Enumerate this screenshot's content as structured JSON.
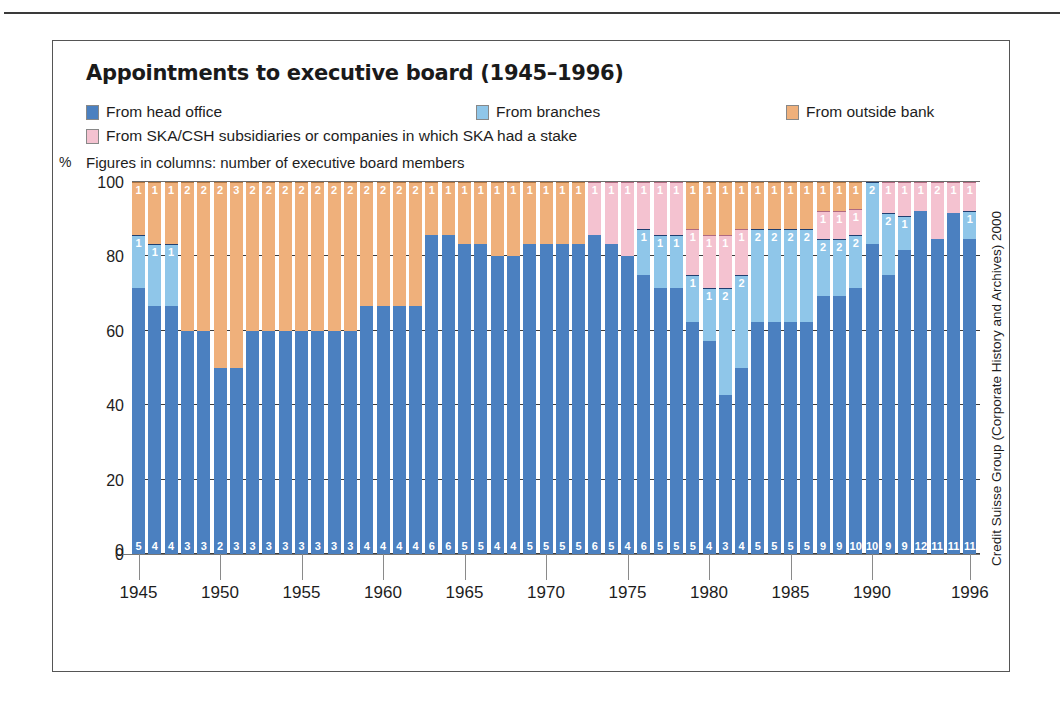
{
  "title": "Appointments to executive board (1945–1996)",
  "note": "Figures in columns: number of executive board members",
  "pct_symbol": "%",
  "source": "Credit Suisse Group (Corporate History and Archives) 2000",
  "colors": {
    "head_office": "#4b80c0",
    "branches": "#8fc6e9",
    "outside_bank": "#efb07b",
    "subsidiaries": "#f4c2d0"
  },
  "legend": [
    {
      "label": "From head office",
      "color_key": "head_office",
      "row": 0,
      "x": 0
    },
    {
      "label": "From branches",
      "color_key": "branches",
      "row": 0,
      "x": 390
    },
    {
      "label": "From outside bank",
      "color_key": "outside_bank",
      "row": 0,
      "x": 700
    },
    {
      "label": "From SKA/CSH subsidiaries or companies in which SKA had a stake",
      "color_key": "subsidiaries",
      "row": 1,
      "x": 0
    }
  ],
  "chart_data": {
    "type": "bar",
    "subtype": "100% stacked column",
    "title": "Appointments to executive board (1945–1996)",
    "xlabel": "",
    "ylabel": "%",
    "ylim": [
      0,
      100
    ],
    "yticks": [
      0,
      20,
      40,
      60,
      80,
      100
    ],
    "grid": true,
    "legend_position": "top",
    "note": "Figures in columns: number of executive board members",
    "source": "Credit Suisse Group (Corporate History and Archives) 2000",
    "series_order": [
      "head_office",
      "branches",
      "subsidiaries",
      "outside_bank"
    ],
    "series_labels": {
      "head_office": "From head office",
      "branches": "From branches",
      "subsidiaries": "From SKA/CSH subsidiaries or companies in which SKA had a stake",
      "outside_bank": "From outside bank"
    },
    "x_tick_years": [
      1945,
      1950,
      1955,
      1960,
      1965,
      1970,
      1975,
      1980,
      1985,
      1990,
      1996
    ],
    "categories": [
      1945,
      1946,
      1947,
      1948,
      1949,
      1950,
      1951,
      1952,
      1953,
      1954,
      1955,
      1956,
      1957,
      1958,
      1959,
      1960,
      1961,
      1962,
      1963,
      1964,
      1965,
      1966,
      1967,
      1968,
      1969,
      1970,
      1971,
      1972,
      1973,
      1974,
      1975,
      1976,
      1977,
      1978,
      1979,
      1980,
      1981,
      1982,
      1983,
      1984,
      1985,
      1986,
      1987,
      1988,
      1989,
      1990,
      1991,
      1992,
      1993,
      1994,
      1995,
      1996
    ],
    "columns": [
      {
        "year": 1945,
        "head_office": 5,
        "branches": 1,
        "subsidiaries": 0,
        "outside_bank": 1
      },
      {
        "year": 1946,
        "head_office": 4,
        "branches": 1,
        "subsidiaries": 0,
        "outside_bank": 1
      },
      {
        "year": 1947,
        "head_office": 4,
        "branches": 1,
        "subsidiaries": 0,
        "outside_bank": 1
      },
      {
        "year": 1948,
        "head_office": 3,
        "branches": 0,
        "subsidiaries": 0,
        "outside_bank": 2
      },
      {
        "year": 1949,
        "head_office": 3,
        "branches": 0,
        "subsidiaries": 0,
        "outside_bank": 2
      },
      {
        "year": 1950,
        "head_office": 2,
        "branches": 0,
        "subsidiaries": 0,
        "outside_bank": 2
      },
      {
        "year": 1951,
        "head_office": 3,
        "branches": 0,
        "subsidiaries": 0,
        "outside_bank": 3
      },
      {
        "year": 1952,
        "head_office": 3,
        "branches": 0,
        "subsidiaries": 0,
        "outside_bank": 2
      },
      {
        "year": 1953,
        "head_office": 3,
        "branches": 0,
        "subsidiaries": 0,
        "outside_bank": 2
      },
      {
        "year": 1954,
        "head_office": 3,
        "branches": 0,
        "subsidiaries": 0,
        "outside_bank": 2
      },
      {
        "year": 1955,
        "head_office": 3,
        "branches": 0,
        "subsidiaries": 0,
        "outside_bank": 2
      },
      {
        "year": 1956,
        "head_office": 3,
        "branches": 0,
        "subsidiaries": 0,
        "outside_bank": 2
      },
      {
        "year": 1957,
        "head_office": 3,
        "branches": 0,
        "subsidiaries": 0,
        "outside_bank": 2
      },
      {
        "year": 1958,
        "head_office": 3,
        "branches": 0,
        "subsidiaries": 0,
        "outside_bank": 2
      },
      {
        "year": 1959,
        "head_office": 4,
        "branches": 0,
        "subsidiaries": 0,
        "outside_bank": 2
      },
      {
        "year": 1960,
        "head_office": 4,
        "branches": 0,
        "subsidiaries": 0,
        "outside_bank": 2
      },
      {
        "year": 1961,
        "head_office": 4,
        "branches": 0,
        "subsidiaries": 0,
        "outside_bank": 2
      },
      {
        "year": 1962,
        "head_office": 4,
        "branches": 0,
        "subsidiaries": 0,
        "outside_bank": 2
      },
      {
        "year": 1963,
        "head_office": 6,
        "branches": 0,
        "subsidiaries": 0,
        "outside_bank": 1
      },
      {
        "year": 1964,
        "head_office": 6,
        "branches": 0,
        "subsidiaries": 0,
        "outside_bank": 1
      },
      {
        "year": 1965,
        "head_office": 5,
        "branches": 0,
        "subsidiaries": 0,
        "outside_bank": 1
      },
      {
        "year": 1966,
        "head_office": 5,
        "branches": 0,
        "subsidiaries": 0,
        "outside_bank": 1
      },
      {
        "year": 1967,
        "head_office": 4,
        "branches": 0,
        "subsidiaries": 0,
        "outside_bank": 1
      },
      {
        "year": 1968,
        "head_office": 4,
        "branches": 0,
        "subsidiaries": 0,
        "outside_bank": 1
      },
      {
        "year": 1969,
        "head_office": 5,
        "branches": 0,
        "subsidiaries": 0,
        "outside_bank": 1
      },
      {
        "year": 1970,
        "head_office": 5,
        "branches": 0,
        "subsidiaries": 0,
        "outside_bank": 1
      },
      {
        "year": 1971,
        "head_office": 5,
        "branches": 0,
        "subsidiaries": 0,
        "outside_bank": 1
      },
      {
        "year": 1972,
        "head_office": 5,
        "branches": 0,
        "subsidiaries": 0,
        "outside_bank": 1
      },
      {
        "year": 1973,
        "head_office": 6,
        "branches": 0,
        "subsidiaries": 1,
        "outside_bank": 0
      },
      {
        "year": 1974,
        "head_office": 5,
        "branches": 0,
        "subsidiaries": 1,
        "outside_bank": 0
      },
      {
        "year": 1975,
        "head_office": 4,
        "branches": 0,
        "subsidiaries": 1,
        "outside_bank": 0
      },
      {
        "year": 1976,
        "head_office": 6,
        "branches": 1,
        "subsidiaries": 1,
        "outside_bank": 0
      },
      {
        "year": 1977,
        "head_office": 5,
        "branches": 1,
        "subsidiaries": 1,
        "outside_bank": 0
      },
      {
        "year": 1978,
        "head_office": 5,
        "branches": 1,
        "subsidiaries": 1,
        "outside_bank": 0
      },
      {
        "year": 1979,
        "head_office": 5,
        "branches": 1,
        "subsidiaries": 1,
        "outside_bank": 1
      },
      {
        "year": 1980,
        "head_office": 4,
        "branches": 1,
        "subsidiaries": 1,
        "outside_bank": 1
      },
      {
        "year": 1981,
        "head_office": 3,
        "branches": 2,
        "subsidiaries": 1,
        "outside_bank": 1
      },
      {
        "year": 1982,
        "head_office": 4,
        "branches": 2,
        "subsidiaries": 1,
        "outside_bank": 1
      },
      {
        "year": 1983,
        "head_office": 5,
        "branches": 2,
        "subsidiaries": 0,
        "outside_bank": 1
      },
      {
        "year": 1984,
        "head_office": 5,
        "branches": 2,
        "subsidiaries": 0,
        "outside_bank": 1
      },
      {
        "year": 1985,
        "head_office": 5,
        "branches": 2,
        "subsidiaries": 0,
        "outside_bank": 1
      },
      {
        "year": 1986,
        "head_office": 5,
        "branches": 2,
        "subsidiaries": 0,
        "outside_bank": 1
      },
      {
        "year": 1987,
        "head_office": 9,
        "branches": 2,
        "subsidiaries": 1,
        "outside_bank": 1
      },
      {
        "year": 1988,
        "head_office": 9,
        "branches": 2,
        "subsidiaries": 1,
        "outside_bank": 1
      },
      {
        "year": 1989,
        "head_office": 10,
        "branches": 2,
        "subsidiaries": 1,
        "outside_bank": 1
      },
      {
        "year": 1990,
        "head_office": 10,
        "branches": 2,
        "subsidiaries": 0,
        "outside_bank": 0
      },
      {
        "year": 1991,
        "head_office": 9,
        "branches": 2,
        "subsidiaries": 1,
        "outside_bank": 0
      },
      {
        "year": 1992,
        "head_office": 9,
        "branches": 1,
        "subsidiaries": 1,
        "outside_bank": 0
      },
      {
        "year": 1993,
        "head_office": 12,
        "branches": 0,
        "subsidiaries": 1,
        "outside_bank": 0
      },
      {
        "year": 1994,
        "head_office": 11,
        "branches": 0,
        "subsidiaries": 2,
        "outside_bank": 0
      },
      {
        "year": 1995,
        "head_office": 11,
        "branches": 0,
        "subsidiaries": 1,
        "outside_bank": 0
      },
      {
        "year": 1996,
        "head_office": 11,
        "branches": 1,
        "subsidiaries": 1,
        "outside_bank": 0
      }
    ]
  }
}
